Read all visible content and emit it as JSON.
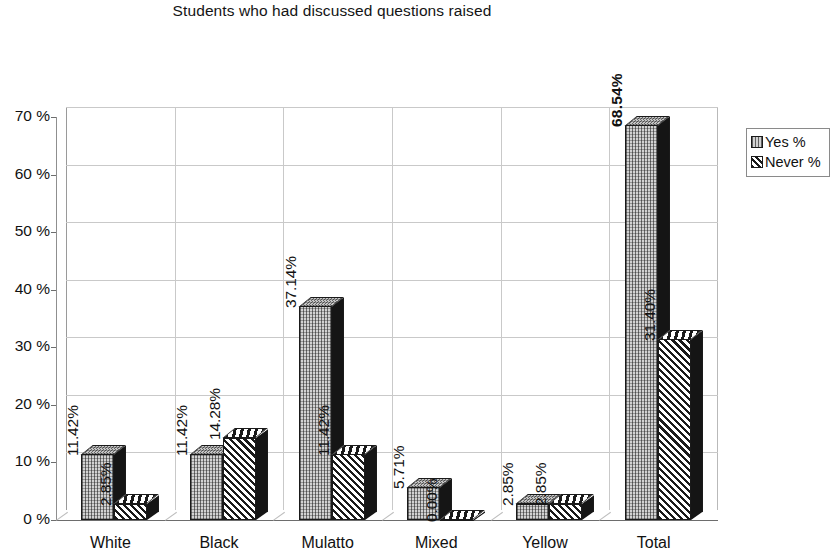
{
  "chart_data": {
    "type": "bar",
    "title": "Students who had discussed questions raised",
    "xlabel": "",
    "ylabel": "",
    "ylim": [
      0,
      70
    ],
    "ytick_labels": [
      "0 %",
      "10 %",
      "20 %",
      "30 %",
      "40 %",
      "50 %",
      "60 %",
      "70 %"
    ],
    "ytick_values": [
      0,
      10,
      20,
      30,
      40,
      50,
      60,
      70
    ],
    "grid": true,
    "legend_position": "right",
    "categories": [
      "White",
      "Black",
      "Mulatto",
      "Mixed",
      "Yellow",
      "Total"
    ],
    "series": [
      {
        "name": "Yes %",
        "values": [
          11.42,
          11.42,
          37.14,
          5.71,
          2.85,
          68.54
        ],
        "labels": [
          "11.42%",
          "11.42%",
          "37.14%",
          "5.71%",
          "2.85%",
          "68.54%"
        ]
      },
      {
        "name": "Never %",
        "values": [
          2.85,
          14.28,
          11.42,
          0.0,
          2.85,
          31.4
        ],
        "labels": [
          "2.85%",
          "14.28%",
          "11.42%",
          "0.00%",
          "2.85%",
          "31.40%"
        ]
      }
    ]
  },
  "legend": {
    "items": [
      {
        "label": "Yes %",
        "swatch": "stipple-light-swatch"
      },
      {
        "label": "Never %",
        "swatch": "diagonal-hatch-swatch"
      }
    ]
  },
  "colors": {
    "background": "#ffffff",
    "axis": "#6d6d6d",
    "gridline": "#c9c9c9",
    "series_yes_fill": "#d2d2d2",
    "series_never_fill": "#1a1a1a",
    "text": "#111111"
  }
}
